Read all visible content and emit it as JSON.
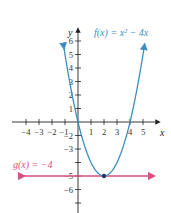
{
  "chart_data": {
    "type": "line",
    "title": "",
    "xlabel": "x",
    "ylabel": "y",
    "xlim": [
      -4.5,
      5.8
    ],
    "ylim": [
      -6.8,
      7
    ],
    "grid": false,
    "x_ticks": [
      -4,
      -3,
      -2,
      -1,
      1,
      2,
      3,
      4,
      5
    ],
    "y_ticks": [
      6,
      5,
      4,
      3,
      2,
      1,
      -2,
      -3,
      -5,
      -6
    ],
    "x_tick_labels": [
      "−4",
      "−3",
      "−2",
      "−1",
      "1",
      "2",
      "3",
      "4",
      "5"
    ],
    "y_tick_labels": [
      "6",
      "5",
      "4",
      "3",
      "2",
      "1",
      "−2",
      "−3",
      "−5",
      "−6"
    ],
    "series": [
      {
        "name": "f(x) = x² − 4x",
        "expression": "x^2 - 4x",
        "color": "#3a8fc0",
        "points": [
          [
            -1.1,
            5.61
          ],
          [
            0,
            0
          ],
          [
            1,
            -3
          ],
          [
            2,
            -4
          ],
          [
            3,
            -3
          ],
          [
            4,
            0
          ],
          [
            5.1,
            5.61
          ]
        ]
      },
      {
        "name": "g(x) = −4",
        "expression": "-4",
        "color": "#d94f7e",
        "points": [
          [
            -5,
            -4
          ],
          [
            6,
            -4
          ]
        ]
      }
    ],
    "annotations": [
      {
        "text": "f(x) = x² − 4x",
        "x": 1.6,
        "y": 6.4,
        "color": "#3a8fc0"
      },
      {
        "text": "g(x) = −4",
        "x": -5.3,
        "y": -3.3,
        "color": "#d94f7e"
      },
      {
        "type": "point",
        "x": 2,
        "y": -4,
        "label": "intersection/vertex"
      }
    ]
  },
  "labels": {
    "f_label": "f(x) = x² − 4x",
    "g_label": "g(x) = −4",
    "x_axis": "x",
    "y_axis": "y"
  }
}
